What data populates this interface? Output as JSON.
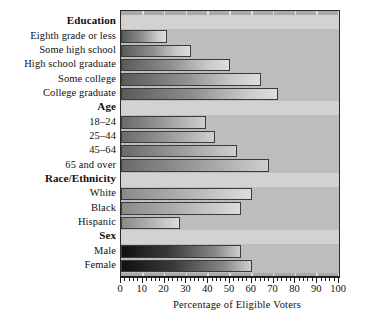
{
  "chart_data": {
    "type": "bar",
    "orientation": "horizontal",
    "title": "",
    "xlabel": "Percentage of Eligible Voters",
    "ylabel": "",
    "xlim": [
      0,
      100
    ],
    "xticks": [
      0,
      10,
      20,
      30,
      40,
      50,
      60,
      70,
      80,
      90,
      100
    ],
    "xtick_labels": [
      "0",
      "10",
      "20",
      "30",
      "40",
      "50",
      "60",
      "70",
      "80",
      "90",
      "100"
    ],
    "minor_ticks": true,
    "grid": "vertical-white-gridlines",
    "legend": null,
    "groups": [
      {
        "name": "Education",
        "categories": [
          "Eighth grade or less",
          "Some high school",
          "High school graduate",
          "Some college",
          "College graduate"
        ],
        "values": [
          21,
          32,
          50,
          64,
          72
        ]
      },
      {
        "name": "Age",
        "categories": [
          "18–24",
          "25–44",
          "45–64",
          "65 and over"
        ],
        "values": [
          39,
          43,
          53,
          68
        ]
      },
      {
        "name": "Race/Ethnicity",
        "categories": [
          "White",
          "Black",
          "Hispanic"
        ],
        "values": [
          60,
          55,
          27
        ]
      },
      {
        "name": "Sex",
        "categories": [
          "Male",
          "Female"
        ],
        "values": [
          55,
          60
        ]
      }
    ],
    "categories": [
      "Eighth grade or less",
      "Some high school",
      "High school graduate",
      "Some college",
      "College graduate",
      "18–24",
      "25–44",
      "45–64",
      "65 and over",
      "White",
      "Black",
      "Hispanic",
      "Male",
      "Female"
    ],
    "values": [
      21,
      32,
      50,
      64,
      72,
      39,
      43,
      53,
      68,
      60,
      55,
      27,
      55,
      60
    ],
    "colors": {
      "plot_background": "#a9a9a9",
      "gridline": "#e8e8e8",
      "axis": "#1b1b1b",
      "bar_light": "#dedede",
      "bar_dark": "#101010",
      "text": "#111111"
    }
  },
  "rows": [
    {
      "kind": "header",
      "label": "Education",
      "value": null,
      "shade": ""
    },
    {
      "kind": "bar",
      "label": "Eighth grade or less",
      "value": 21,
      "shade": "shade-a"
    },
    {
      "kind": "bar",
      "label": "Some high school",
      "value": 32,
      "shade": "shade-a"
    },
    {
      "kind": "bar",
      "label": "High school graduate",
      "value": 50,
      "shade": "shade-a"
    },
    {
      "kind": "bar",
      "label": "Some college",
      "value": 64,
      "shade": "shade-a"
    },
    {
      "kind": "bar",
      "label": "College graduate",
      "value": 72,
      "shade": "shade-a"
    },
    {
      "kind": "header",
      "label": "Age",
      "value": null,
      "shade": ""
    },
    {
      "kind": "bar",
      "label": "18–24",
      "value": 39,
      "shade": "shade-b"
    },
    {
      "kind": "bar",
      "label": "25–44",
      "value": 43,
      "shade": "shade-b"
    },
    {
      "kind": "bar",
      "label": "45–64",
      "value": 53,
      "shade": "shade-b"
    },
    {
      "kind": "bar",
      "label": "65 and over",
      "value": 68,
      "shade": "shade-b"
    },
    {
      "kind": "header",
      "label": "Race/Ethnicity",
      "value": null,
      "shade": ""
    },
    {
      "kind": "bar",
      "label": "White",
      "value": 60,
      "shade": "shade-c"
    },
    {
      "kind": "bar",
      "label": "Black",
      "value": 55,
      "shade": "shade-c"
    },
    {
      "kind": "bar",
      "label": "Hispanic",
      "value": 27,
      "shade": "shade-c"
    },
    {
      "kind": "header",
      "label": "Sex",
      "value": null,
      "shade": ""
    },
    {
      "kind": "bar",
      "label": "Male",
      "value": 55,
      "shade": "shade-d"
    },
    {
      "kind": "bar",
      "label": "Female",
      "value": 60,
      "shade": "shade-d"
    }
  ]
}
